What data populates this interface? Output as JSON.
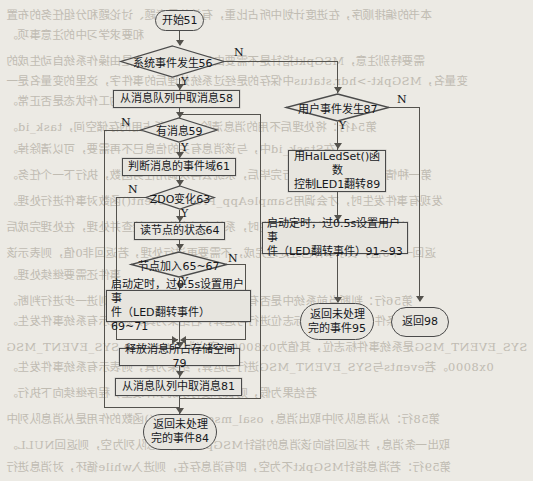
{
  "diagram": {
    "type": "flowchart",
    "language": "zh-CN"
  },
  "nodes": {
    "start": "开始51",
    "sys_event": "系统事件发生56",
    "get_msg_58": "从消息队列中取消息58",
    "has_msg_59": "有消息59",
    "judge_domain_61": "判断消息的事件域61",
    "zdo_change_63": "ZDO变化63",
    "read_node_state_64": "读节点的状态64",
    "node_join_65": "节点加入65~67",
    "timer_left_line1": "启动定时，过0.5s设置用户事",
    "timer_left_line2": "件（LED翻转事件）69~71",
    "free_mem_79": "释放消息所占存储空间79",
    "get_msg_81": "从消息队列中取消息81",
    "return_unproc_84_line1": "返回未处理",
    "return_unproc_84_line2": "完的事件84",
    "user_event_87": "用户事件发生87",
    "halledset_89_line1": "用HalLedSet()函数",
    "halledset_89_line2": "控制LED1翻转89",
    "timer_right_line1": "启动定时，过0.5s设置用户事",
    "timer_right_line2": "件（LED翻转事件）91~93",
    "return_unproc_95_line1": "返回未处理",
    "return_unproc_95_line2": "完的事件95",
    "return_98": "返回98"
  },
  "edge_labels": {
    "sys_event_n": "N",
    "sys_event_y": "Y",
    "has_msg_n": "N",
    "has_msg_y": "Y",
    "zdo_n": "N",
    "zdo_y": "Y",
    "node_join_n": "N",
    "node_join_y": "Y",
    "user_event_n": "N",
    "user_event_y": "Y"
  },
  "background_text": {
    "lines": [
      "本书的编排顺序，在进度计划中所占比重，有关的思考题、讨论题和分组任务的布置",
      "和要求学习中的注意事项。",
      "需要特别注意，MSGpkt指针是不需要由用户定义的，它是由操作系统自动生成的",
      "变量名，MSGpkt->hdr.status中保存的是经过系统处理后的事件字，这里的变量名是一",
      "的工作状态是否正常。",
      "第54行：将处理后不用的消息清除，释放所占用的存储空间，task_id。",
      "在Stask_id中，与该消息有关的信息已不再需要，可以清除掉。",
      "第一种情况，当一个任务执行完毕后，系统会再次调用任务函数，执行下一个任务。",
      "发现有事件发生时，才会调用SampleApp_ProcessEvent()函数对事件进行处理。",
      "当由系统或用户触发事件发生时，系统会对事件逐一检查并处理，在处理完成后",
      "返回一个0值，表示事件已经处理完成，不需要再进行处理，若返回非0值，则表示该",
      "事件还需要继续处理。",
      "第56行：判断当前系统中是否有事件发生，若有事件发生，则进一步进行判断。",
      "其判断的条件是与系统事件标志位进行与运算，若结果为真，则表示有系统事件发生。",
      "SYS_EVENT_MSG是系统事件标志位，其值为0x8000，定义为：#define SYS_EVENT_MSG",
      "0x8000。若events与SYS_EVENT_MSG进行与运算，结果为真，则表示有系统事件发生。",
      "若结果为假，则表示没有系统事件发生，程序继续向下执行。",
      "第58行：从消息队列中取出消息，osal_msg_receive()函数的作用是从消息队列中",
      "取出一条消息，并返回指向该消息的指针MSGpkt，若消息队列为空，则返回NULL。",
      "第59行：若消息指针MSGpkt不为空，即有消息存在，则进入while循环，对消息进行",
      "处理，若消息指针为空，则退出循环，结束本次事件处理过程。"
    ]
  }
}
